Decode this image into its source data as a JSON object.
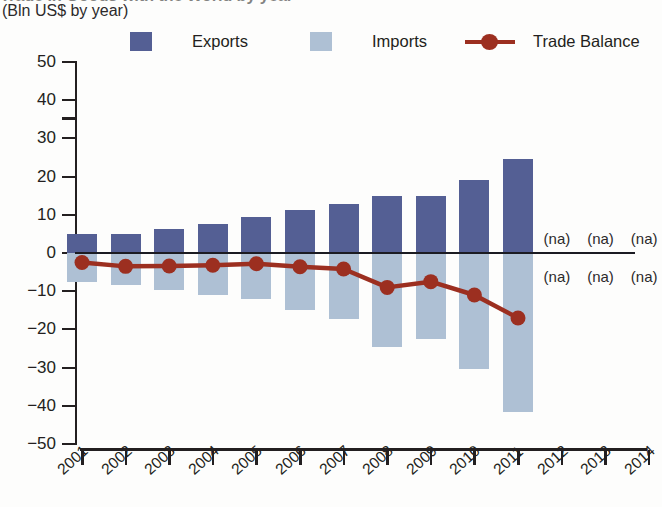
{
  "header": {
    "title": "Trade in Goods with the World by year",
    "subtitle": "(Bln US$ by year)"
  },
  "legend": {
    "position": "top",
    "items": [
      {
        "label": "Exports",
        "type": "bar",
        "color": "#545f94",
        "icon": "square-swatch"
      },
      {
        "label": "Imports",
        "type": "bar",
        "color": "#aec0d4",
        "icon": "square-swatch"
      },
      {
        "label": "Trade Balance",
        "type": "line",
        "color": "#9c2f20",
        "icon": "line-marker-swatch"
      }
    ]
  },
  "na_text": "(na)",
  "chart_data": {
    "type": "bar",
    "title": "Trade in Goods with the World by year",
    "subtitle": "(Bln US$ by year)",
    "xlabel": "",
    "ylabel": "(Bln US$ by year)",
    "ylim": [
      -50,
      50
    ],
    "yticks": [
      "50",
      "40",
      "30",
      "20",
      "10",
      "0",
      "-10",
      "-20",
      "-30",
      "-40",
      "-50"
    ],
    "ytick_values": [
      50,
      40,
      30,
      20,
      10,
      0,
      -10,
      -20,
      -30,
      -40,
      -50
    ],
    "grid": false,
    "legend_position": "top",
    "categories": [
      "2001",
      "2002",
      "2003",
      "2004",
      "2005",
      "2006",
      "2007",
      "2008",
      "2009",
      "2010",
      "2011",
      "2012",
      "2013",
      "2014"
    ],
    "series": [
      {
        "name": "Exports",
        "type": "bar",
        "color": "#545f94",
        "values": [
          5.0,
          5.0,
          6.3,
          7.7,
          9.3,
          11.3,
          12.9,
          15.0,
          15.0,
          19.0,
          24.5,
          null,
          null,
          null
        ]
      },
      {
        "name": "Imports",
        "type": "bar",
        "color": "#aec0d4",
        "values": [
          -7.5,
          -8.5,
          -9.7,
          -11.0,
          -12.0,
          -14.8,
          -17.2,
          -24.5,
          -22.5,
          -30.3,
          -41.5,
          null,
          null,
          null
        ]
      },
      {
        "name": "Trade Balance",
        "type": "line",
        "color": "#9c2f20",
        "values": [
          -2.5,
          -3.5,
          -3.4,
          -3.2,
          -2.8,
          -3.6,
          -4.2,
          -9.0,
          -7.5,
          -11.0,
          -17.0,
          null,
          null,
          null
        ]
      }
    ],
    "annotations": [
      {
        "text": "(na)",
        "category": "2012",
        "value": 4
      },
      {
        "text": "(na)",
        "category": "2013",
        "value": 4
      },
      {
        "text": "(na)",
        "category": "2014",
        "value": 4
      },
      {
        "text": "(na)",
        "category": "2012",
        "value": -6
      },
      {
        "text": "(na)",
        "category": "2013",
        "value": -6
      },
      {
        "text": "(na)",
        "category": "2014",
        "value": -6
      }
    ]
  }
}
